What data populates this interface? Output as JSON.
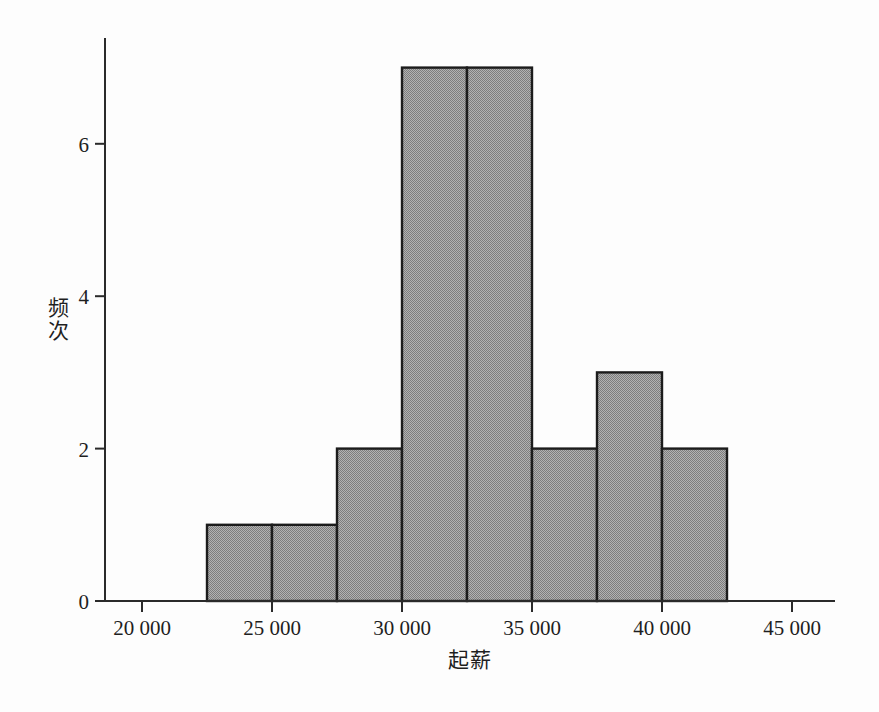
{
  "chart_data": {
    "type": "bar",
    "subtype": "histogram",
    "title": "",
    "xlabel": "起薪",
    "ylabel": "频次",
    "bin_edges": [
      22500,
      25000,
      27500,
      30000,
      32500,
      35000,
      37500,
      40000,
      42500
    ],
    "frequencies": [
      1,
      1,
      2,
      7,
      7,
      2,
      3,
      2
    ],
    "x_ticks": [
      {
        "value": 20000,
        "label": "20 000"
      },
      {
        "value": 25000,
        "label": "25 000"
      },
      {
        "value": 30000,
        "label": "30 000"
      },
      {
        "value": 35000,
        "label": "35 000"
      },
      {
        "value": 40000,
        "label": "40 000"
      },
      {
        "value": 45000,
        "label": "45 000"
      }
    ],
    "y_ticks": [
      {
        "value": 0,
        "label": "0"
      },
      {
        "value": 2,
        "label": "2"
      },
      {
        "value": 4,
        "label": "4"
      },
      {
        "value": 6,
        "label": "6"
      }
    ],
    "x_range": [
      18600,
      46700
    ],
    "y_range": [
      0,
      7.4
    ],
    "grid": false,
    "legend": null,
    "colors": {
      "bar_fill_dark": "#7d7d7d",
      "bar_fill_light": "#b2b2b2",
      "bar_border": "#1c1c1c",
      "axis": "#2a2a2a",
      "text": "#1f1f1f",
      "background": "#fdfdfd"
    }
  }
}
